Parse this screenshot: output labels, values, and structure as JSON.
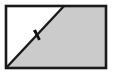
{
  "figure": {
    "kind": "geometry-diagram",
    "canvas": {
      "width": 113,
      "height": 74,
      "background": "#ffffff"
    },
    "rectangle": {
      "name": "rectangle-outline",
      "x": 6,
      "y": 6,
      "width": 100,
      "height": 62,
      "stroke": "#1a1a1a",
      "stroke_width": 2.6,
      "fill": "#ffffff"
    },
    "shaded_region": {
      "name": "shaded-triangle",
      "label": "shaded region",
      "fill": "#cbcbcb",
      "points": "6,68 64,6 106,6 106,68"
    },
    "unshaded_region": {
      "name": "unshaded-triangle",
      "label": "white region",
      "fill": "#ffffff",
      "points": "6,6 64,6 6,68"
    },
    "diagonal": {
      "name": "diagonal-line",
      "x1": 6,
      "y1": 68,
      "x2": 64,
      "y2": 6,
      "stroke": "#1a1a1a",
      "stroke_width": 2.4
    },
    "tick_mark": {
      "name": "congruence-tick-mark",
      "count": 1,
      "center_x": 37,
      "center_y": 35,
      "length": 11,
      "stroke": "#111111",
      "stroke_width": 2.8,
      "angle_deg": 20
    },
    "colors": {
      "outline": "#1a1a1a",
      "shading": "#cbcbcb",
      "background": "#ffffff",
      "tick": "#111111"
    }
  }
}
